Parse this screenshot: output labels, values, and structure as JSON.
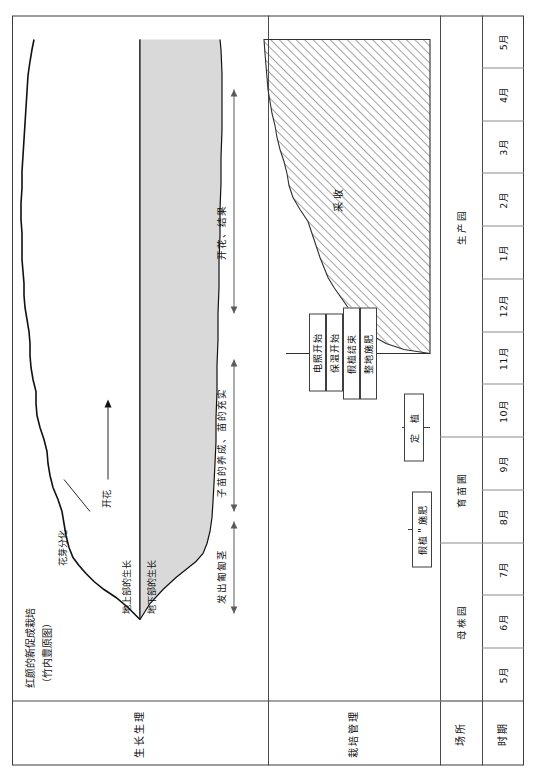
{
  "figure": {
    "title_line1": "红颜的新促成栽培",
    "title_line2": "（竹内豊原图）"
  },
  "row_headers": [
    {
      "id": "growth-physiology",
      "label": "生长生理"
    },
    {
      "id": "cultivation-management",
      "label": "栽培管理"
    },
    {
      "id": "place",
      "label": "场所"
    },
    {
      "id": "period",
      "label": "时期"
    }
  ],
  "timeline": {
    "months": [
      "5月",
      "6月",
      "7月",
      "8月",
      "9月",
      "10月",
      "11月",
      "12月",
      "1月",
      "2月",
      "3月",
      "4月",
      "5月"
    ]
  },
  "places": [
    {
      "label": "母株园",
      "start_month": "5月",
      "span": 3
    },
    {
      "label": "育苗圃",
      "start_month": "8月",
      "span": 2
    },
    {
      "label": "生产园",
      "start_month": "10月",
      "span": 8
    }
  ],
  "growth_curve": {
    "above_ground_label": "地上部的生长",
    "below_ground_label": "地下部的生长",
    "annotations": [
      {
        "id": "flower-bud-differentiation",
        "label": "花芽分化"
      },
      {
        "id": "flowering",
        "label": "开花"
      }
    ]
  },
  "phase_arrows": [
    {
      "id": "runner-emergence",
      "label": "发出匍匐茎"
    },
    {
      "id": "seedling-raising",
      "label": "子苗的养成、苗的充实"
    },
    {
      "id": "flower-fruit",
      "label": "开花、结果"
    }
  ],
  "management_boxes": [
    {
      "id": "temporary-planting",
      "label": "假植＂施肥"
    },
    {
      "id": "planting",
      "label": "定　植"
    },
    {
      "id": "land-prep-fertilizer",
      "label": "整地施肥"
    },
    {
      "id": "temporary-planting-end",
      "label": "假植结束"
    },
    {
      "id": "insulation-start",
      "label": "保温开始"
    },
    {
      "id": "lighting-start",
      "label": "电照开始"
    }
  ],
  "harvest": {
    "label": "采收"
  },
  "colors": {
    "frame": "#3b3b3b",
    "grid": "#8b8b8b",
    "curve": "#111111",
    "fill": "#d9d9d9",
    "hatch": "#4a4a4a",
    "text": "#111111"
  }
}
